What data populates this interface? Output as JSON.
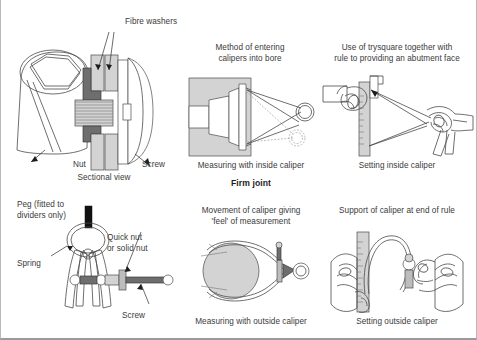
{
  "page": {
    "title": "Firm joint",
    "background_color": "#ffffff",
    "ink_color": "#3a3a3a"
  },
  "section_heading": "Firm joint",
  "panels": [
    {
      "id": "sectional-view",
      "callouts": [
        {
          "name": "fibre-washers",
          "text": "Fibre washers"
        },
        {
          "name": "nut",
          "text": "Nut"
        },
        {
          "name": "screw",
          "text": "Screw"
        }
      ],
      "caption": "Sectional view"
    },
    {
      "id": "entering-calipers-into-bore",
      "title": "Method of entering\ncalipers into bore",
      "caption": "Measuring with inside caliper"
    },
    {
      "id": "trysquare-abutment-face",
      "title": "Use of trysquare together with\nrule to providing an abutment face",
      "caption": "Setting inside caliper"
    },
    {
      "id": "divider-spring-assembly",
      "callouts": [
        {
          "name": "peg",
          "text": "Peg (fitted to\ndividers only)"
        },
        {
          "name": "spring",
          "text": "Spring"
        },
        {
          "name": "quick-nut",
          "text": "Quick nut\nor solid nut"
        },
        {
          "name": "screw",
          "text": "Screw"
        }
      ]
    },
    {
      "id": "caliper-feel-movement",
      "title": "Movement of caliper giving\n'feel' of measurement",
      "caption": "Measuring with outside caliper"
    },
    {
      "id": "caliper-support-end-of-rule",
      "title": "Support of caliper at end of rule",
      "caption": "Setting outside caliper"
    }
  ],
  "colors": {
    "line": "#4a4a4a",
    "light_gray": "#d3d3d3",
    "mid_gray": "#bdbdbd",
    "dark_gray": "#6e6e6e",
    "black": "#111111"
  }
}
